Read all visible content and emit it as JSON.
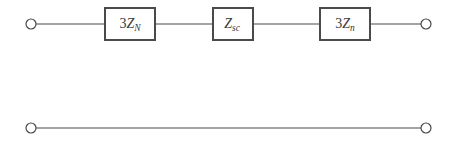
{
  "diagram": {
    "background_color": "#ffffff",
    "line_color": "#4a4a4a",
    "text_color": "#3a3a3a",
    "branches": [
      {
        "name": "top-branch",
        "terminals": [
          {
            "name": "left-terminal",
            "type": "open-circle"
          },
          {
            "name": "right-terminal",
            "type": "open-circle"
          }
        ],
        "elements": [
          {
            "name": "impedance-box-1",
            "label": "3Z_N",
            "coefficient": "3",
            "symbol": "Z",
            "subscript": "N"
          },
          {
            "name": "impedance-box-2",
            "label": "Z_sc",
            "coefficient": "",
            "symbol": "Z",
            "subscript": "sc"
          },
          {
            "name": "impedance-box-3",
            "label": "3Z_n",
            "coefficient": "3",
            "symbol": "Z",
            "subscript": "n"
          }
        ]
      },
      {
        "name": "bottom-branch",
        "terminals": [
          {
            "name": "left-terminal",
            "type": "open-circle"
          },
          {
            "name": "right-terminal",
            "type": "open-circle"
          }
        ],
        "elements": []
      }
    ]
  }
}
